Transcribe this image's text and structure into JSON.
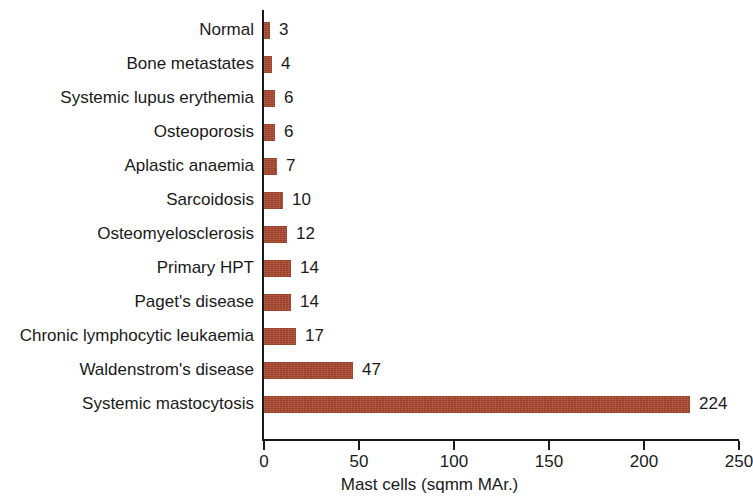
{
  "chart_data": {
    "type": "bar",
    "orientation": "horizontal",
    "title": "",
    "xlabel": "Mast cells (sqmm MAr.)",
    "ylabel": "",
    "xlim": [
      0,
      250
    ],
    "grid": false,
    "legend": null,
    "bar_color": "#a9462c",
    "axis_color": "#1a1a1a",
    "xticks": [
      0,
      50,
      100,
      150,
      200,
      250
    ],
    "xtick_labels": [
      "0",
      "50",
      "100",
      "150",
      "200",
      "250"
    ],
    "categories": [
      "Normal",
      "Bone metastates",
      "Systemic lupus erythemia",
      "Osteoporosis",
      "Aplastic anaemia",
      "Sarcoidosis",
      "Osteomyelosclerosis",
      "Primary HPT",
      "Paget's disease",
      "Chronic lymphocytic leukaemia",
      "Waldenstrom's disease",
      "Systemic mastocytosis"
    ],
    "values": [
      3,
      4,
      6,
      6,
      7,
      10,
      12,
      14,
      14,
      17,
      47,
      224
    ],
    "value_labels": [
      "3",
      "4",
      "6",
      "6",
      "7",
      "10",
      "12",
      "14",
      "14",
      "17",
      "47",
      "224"
    ]
  }
}
